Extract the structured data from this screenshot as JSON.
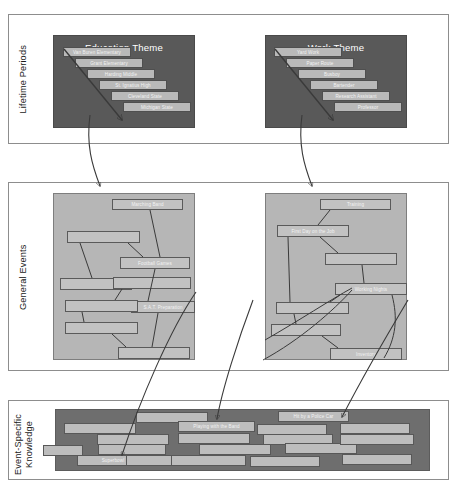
{
  "diagram": {
    "colors": {
      "page_background": "#ffffff",
      "tier_border": "#8d8d8d",
      "dark_panel": "#595959",
      "mid_panel": "#b6b6b6",
      "esk_strip": "#6e6e6e",
      "node_fill": "#b9b9b9",
      "node_border": "#4f4f4f",
      "node_text": "#f2f2f2",
      "panel_title_text": "#ffffff",
      "caption_text": "#1b1b1b",
      "connector": "#3a3a3a"
    }
  },
  "tiers": [
    {
      "id": "lifetime-periods",
      "caption": "Lifetime Periods"
    },
    {
      "id": "general-events",
      "caption": "General Events"
    },
    {
      "id": "event-specific-knowledge",
      "caption": "Event-Specific\nKnowledge"
    }
  ],
  "lifetime_periods": {
    "themes": [
      {
        "id": "education-theme",
        "title": "Education Theme",
        "items": [
          {
            "label": "Van Buren Elementary"
          },
          {
            "label": "Grant Elementary"
          },
          {
            "label": "Harding Middle"
          },
          {
            "label": "St. Ignatius High"
          },
          {
            "label": "Cleveland State"
          },
          {
            "label": "Michigan State"
          }
        ]
      },
      {
        "id": "work-theme",
        "title": "Work Theme",
        "items": [
          {
            "label": "Yard Work"
          },
          {
            "label": "Paper Route"
          },
          {
            "label": "Busboy"
          },
          {
            "label": "Bartender"
          },
          {
            "label": "Research Assistant"
          },
          {
            "label": "Professor"
          }
        ]
      }
    ]
  },
  "general_events": {
    "clusters": [
      {
        "id": "education-general-events",
        "items": [
          {
            "label": "Marching Band"
          },
          {
            "label": ""
          },
          {
            "label": "Football Games"
          },
          {
            "label": ""
          },
          {
            "label": ""
          },
          {
            "label": "S.A.T. Preparation"
          },
          {
            "label": "Math Analysis"
          },
          {
            "label": ""
          }
        ]
      },
      {
        "id": "work-general-events",
        "items": [
          {
            "label": "Training"
          },
          {
            "label": "First Day on the Job"
          },
          {
            "label": ""
          },
          {
            "label": "Working Nights"
          },
          {
            "label": ""
          },
          {
            "label": ""
          },
          {
            "label": "Inventory"
          }
        ]
      }
    ]
  },
  "event_specific_knowledge": {
    "items": [
      {
        "label": ""
      },
      {
        "label": ""
      },
      {
        "label": ""
      },
      {
        "label": "Playing with the Band"
      },
      {
        "label": "Hit by a Police Car"
      },
      {
        "label": ""
      },
      {
        "label": ""
      },
      {
        "label": ""
      },
      {
        "label": ""
      },
      {
        "label": ""
      },
      {
        "label": "Superbowl"
      },
      {
        "label": ""
      },
      {
        "label": ""
      },
      {
        "label": ""
      },
      {
        "label": ""
      },
      {
        "label": ""
      },
      {
        "label": ""
      },
      {
        "label": ""
      },
      {
        "label": ""
      }
    ]
  }
}
